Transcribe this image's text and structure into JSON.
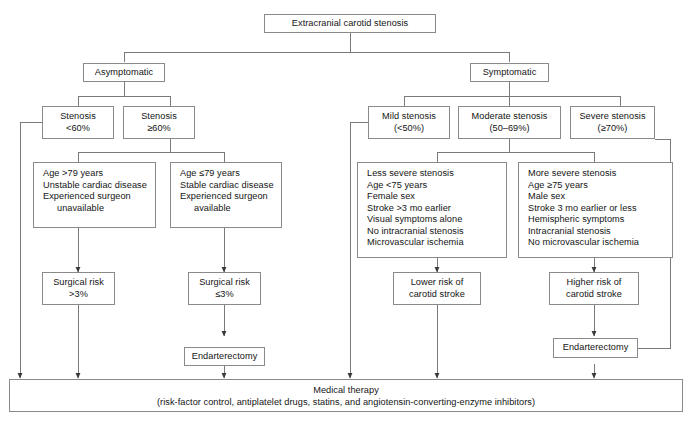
{
  "figure": {
    "type": "flowchart",
    "caption": ""
  },
  "nodes": {
    "root": {
      "label": "Extracranial carotid stenosis"
    },
    "asymptomatic": {
      "label": "Asymptomatic"
    },
    "symptomatic": {
      "label": "Symptomatic"
    },
    "stenosis_lt60": {
      "line1": "Stenosis",
      "line2": "<60%"
    },
    "stenosis_ge60": {
      "line1": "Stenosis",
      "line2": "≥60%"
    },
    "mild": {
      "line1": "Mild stenosis",
      "line2": "(<50%)"
    },
    "moderate": {
      "line1": "Moderate stenosis",
      "line2": "(50–69%)"
    },
    "severe": {
      "line1": "Severe stenosis",
      "line2": "(≥70%)"
    },
    "asym_high_risk": {
      "items": [
        "Age >79 years",
        "Unstable cardiac disease",
        "Experienced surgeon",
        "unavailable"
      ]
    },
    "asym_low_risk": {
      "items": [
        "Age ≤79 years",
        "Stable cardiac disease",
        "Experienced surgeon",
        "available"
      ]
    },
    "less_severe": {
      "items": [
        "Less severe stenosis",
        "Age <75 years",
        "Female sex",
        "Stroke >3 mo earlier",
        "Visual symptoms alone",
        "No intracranial stenosis",
        "Microvascular ischemia"
      ]
    },
    "more_severe": {
      "items": [
        "More severe stenosis",
        "Age ≥75 years",
        "Male sex",
        "Stroke  3 mo earlier or less",
        "Hemispheric symptoms",
        "Intracranial stenosis",
        "No microvascular ischemia"
      ]
    },
    "surg_risk_high": {
      "line1": "Surgical risk",
      "line2": ">3%"
    },
    "surg_risk_low": {
      "line1": "Surgical risk",
      "line2": "≤3%"
    },
    "lower_risk": {
      "line1": "Lower risk of",
      "line2": "carotid stroke"
    },
    "higher_risk": {
      "line1": "Higher risk of",
      "line2": "carotid stroke"
    },
    "endarterectomy_left": {
      "label": "Endarterectomy"
    },
    "endarterectomy_right": {
      "label": "Endarterectomy"
    },
    "medical_therapy": {
      "line1": "Medical therapy",
      "line2": "(risk-factor control, antiplatelet drugs, statins, and angiotensin-converting-enzyme inhibitors)"
    }
  },
  "colors": {
    "border": "#8a8a8a",
    "wire": "#6e6e6e",
    "text": "#141414",
    "background": "#ffffff"
  }
}
